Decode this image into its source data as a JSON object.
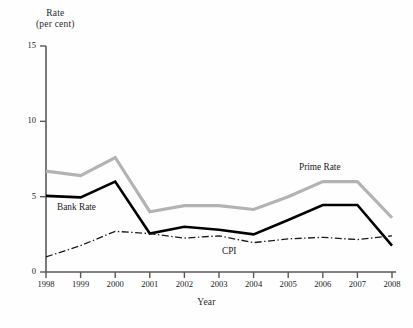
{
  "chart_data": {
    "type": "line",
    "title": "",
    "xlabel": "Year",
    "ylabel": "Rate (per cent)",
    "ylabel_line1": "Rate",
    "ylabel_line2": "(per cent)",
    "grid": false,
    "legend_position": "inline-annotations",
    "categories": [
      1998,
      1999,
      2000,
      2001,
      2002,
      2003,
      2004,
      2005,
      2006,
      2007,
      2008
    ],
    "x": [
      1998,
      1999,
      2000,
      2001,
      2002,
      2003,
      2004,
      2005,
      2006,
      2007,
      2008
    ],
    "xtick_labels": [
      "1998",
      "1999",
      "2000",
      "2001",
      "2002",
      "2003",
      "2004",
      "2005",
      "2006",
      "2007",
      "2008"
    ],
    "ytick_labels": [
      "0",
      "5",
      "10",
      "15"
    ],
    "yticks": [
      0,
      5,
      10,
      15
    ],
    "ylim": [
      0,
      15
    ],
    "xlim": [
      1998,
      2008
    ],
    "series": [
      {
        "name": "Prime Rate",
        "style": "solid",
        "color": "#b3b3b3",
        "width": 3.2,
        "values": [
          6.7,
          6.4,
          7.6,
          4.0,
          4.4,
          4.4,
          4.15,
          5.0,
          6.0,
          6.0,
          3.6
        ]
      },
      {
        "name": "Bank Rate",
        "style": "solid",
        "color": "#000000",
        "width": 2.6,
        "values": [
          5.05,
          4.95,
          6.0,
          2.55,
          3.0,
          2.8,
          2.5,
          3.45,
          4.45,
          4.45,
          1.75
        ]
      },
      {
        "name": "CPI",
        "style": "dash-dot",
        "color": "#1a1a1a",
        "width": 1.3,
        "values": [
          1.0,
          1.75,
          2.7,
          2.55,
          2.25,
          2.4,
          1.95,
          2.2,
          2.3,
          2.15,
          2.4
        ]
      }
    ],
    "annotations": [
      {
        "text": "Bank Rate",
        "x": 1999.6,
        "y": 4.1
      },
      {
        "text": "Prime Rate",
        "x": 2005.5,
        "y": 7.3
      },
      {
        "text": "CPI",
        "x": 2003.1,
        "y": 1.6
      }
    ]
  },
  "axes": {
    "y_title_line1": "Rate",
    "y_title_line2": "(per cent)",
    "x_title": "Year"
  },
  "caption": {
    "text": ""
  }
}
